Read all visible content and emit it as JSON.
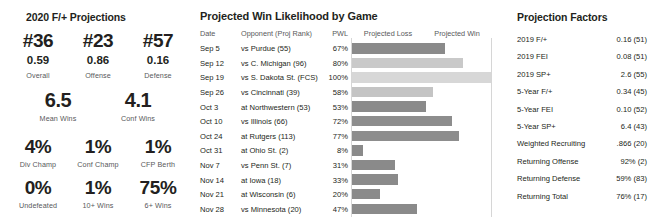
{
  "projections": {
    "title": "2020 F/+ Projections",
    "ranks": [
      {
        "rank": "#36",
        "value": "0.59",
        "label": "Overall"
      },
      {
        "rank": "#23",
        "value": "0.86",
        "label": "Offense"
      },
      {
        "rank": "#57",
        "value": "0.16",
        "label": "Defense"
      }
    ],
    "wins": [
      {
        "value": "6.5",
        "label": "Mean Wins"
      },
      {
        "value": "4.1",
        "label": "Conf Wins"
      }
    ],
    "championship": [
      {
        "value": "4%",
        "label": "Div Champ"
      },
      {
        "value": "1%",
        "label": "Conf Champ"
      },
      {
        "value": "1%",
        "label": "CFP Berth"
      }
    ],
    "season": [
      {
        "value": "0%",
        "label": "Undefeated"
      },
      {
        "value": "1%",
        "label": "10+ Wins"
      },
      {
        "value": "75%",
        "label": "6+ Wins"
      }
    ]
  },
  "games": {
    "title": "Projected Win Likelihood by Game",
    "headers": {
      "date": "Date",
      "opponent": "Opponent (Proj Rank)",
      "pwl": "PWL",
      "projected_loss": "Projected Loss",
      "projected_win": "Projected Win"
    },
    "rows": [
      {
        "date": "Sep 5",
        "opponent": "vs Purdue (55)",
        "pwl": "67%",
        "pwl_value": 67,
        "bar_color": "#8a8a8a"
      },
      {
        "date": "Sep 12",
        "opponent": "vs C. Michigan (96)",
        "pwl": "80%",
        "pwl_value": 80,
        "bar_color": "#c9c9c9"
      },
      {
        "date": "Sep 19",
        "opponent": "vs S. Dakota St. (FCS)",
        "pwl": "100%",
        "pwl_value": 100,
        "bar_color": "#d7d7d7"
      },
      {
        "date": "Sep 26",
        "opponent": "vs Cincinnati (39)",
        "pwl": "58%",
        "pwl_value": 58,
        "bar_color": "#c4c4c4"
      },
      {
        "date": "Oct 3",
        "opponent": "at Northwestern (53)",
        "pwl": "53%",
        "pwl_value": 53,
        "bar_color": "#8a8a8a"
      },
      {
        "date": "Oct 10",
        "opponent": "vs Illinois (66)",
        "pwl": "72%",
        "pwl_value": 72,
        "bar_color": "#8d8d8d"
      },
      {
        "date": "Oct 24",
        "opponent": "at Rutgers (113)",
        "pwl": "77%",
        "pwl_value": 77,
        "bar_color": "#8d8d8d"
      },
      {
        "date": "Oct 31",
        "opponent": "at Ohio St. (2)",
        "pwl": "8%",
        "pwl_value": 8,
        "bar_color": "#8a8a8a"
      },
      {
        "date": "Nov 7",
        "opponent": "vs Penn St. (7)",
        "pwl": "31%",
        "pwl_value": 31,
        "bar_color": "#8a8a8a"
      },
      {
        "date": "Nov 14",
        "opponent": "at Iowa (18)",
        "pwl": "33%",
        "pwl_value": 33,
        "bar_color": "#8a8a8a"
      },
      {
        "date": "Nov 21",
        "opponent": "at Wisconsin (6)",
        "pwl": "20%",
        "pwl_value": 20,
        "bar_color": "#8a8a8a"
      },
      {
        "date": "Nov 28",
        "opponent": "vs Minnesota (20)",
        "pwl": "47%",
        "pwl_value": 47,
        "bar_color": "#8a8a8a"
      }
    ]
  },
  "factors": {
    "title": "Projection Factors",
    "rows": [
      {
        "label": "2019 F/+",
        "value": "0.16 (51)"
      },
      {
        "label": "2019 FEI",
        "value": "0.08 (51)"
      },
      {
        "label": "2019 SP+",
        "value": "2.6 (55)"
      },
      {
        "label": "5-Year F/+",
        "value": "0.34 (45)"
      },
      {
        "label": "5-Year FEI",
        "value": "0.10 (52)"
      },
      {
        "label": "5-Year SP+",
        "value": "6.4 (43)"
      },
      {
        "label": "Weighted Recruiting",
        "value": ".866 (20)"
      },
      {
        "label": "Returning Offense",
        "value": "92% (2)"
      },
      {
        "label": "Returning Defense",
        "value": "59% (83)"
      },
      {
        "label": "Returning Total",
        "value": "76% (17)"
      }
    ]
  },
  "chart_data": {
    "type": "bar",
    "title": "Projected Win Likelihood by Game",
    "xlabel": "",
    "ylabel": "",
    "xlim": [
      0,
      100
    ],
    "grid": false,
    "legend": [
      "Projected Loss",
      "Projected Win"
    ],
    "legend_position": "top",
    "categories": [
      "Sep 5 vs Purdue (55)",
      "Sep 12 vs C. Michigan (96)",
      "Sep 19 vs S. Dakota St. (FCS)",
      "Sep 26 vs Cincinnati (39)",
      "Oct 3 at Northwestern (53)",
      "Oct 10 vs Illinois (66)",
      "Oct 24 at Rutgers (113)",
      "Oct 31 at Ohio St. (2)",
      "Nov 7 vs Penn St. (7)",
      "Nov 14 at Iowa (18)",
      "Nov 21 at Wisconsin (6)",
      "Nov 28 vs Minnesota (20)"
    ],
    "values": [
      67,
      80,
      100,
      58,
      53,
      72,
      77,
      8,
      31,
      33,
      20,
      47
    ]
  }
}
